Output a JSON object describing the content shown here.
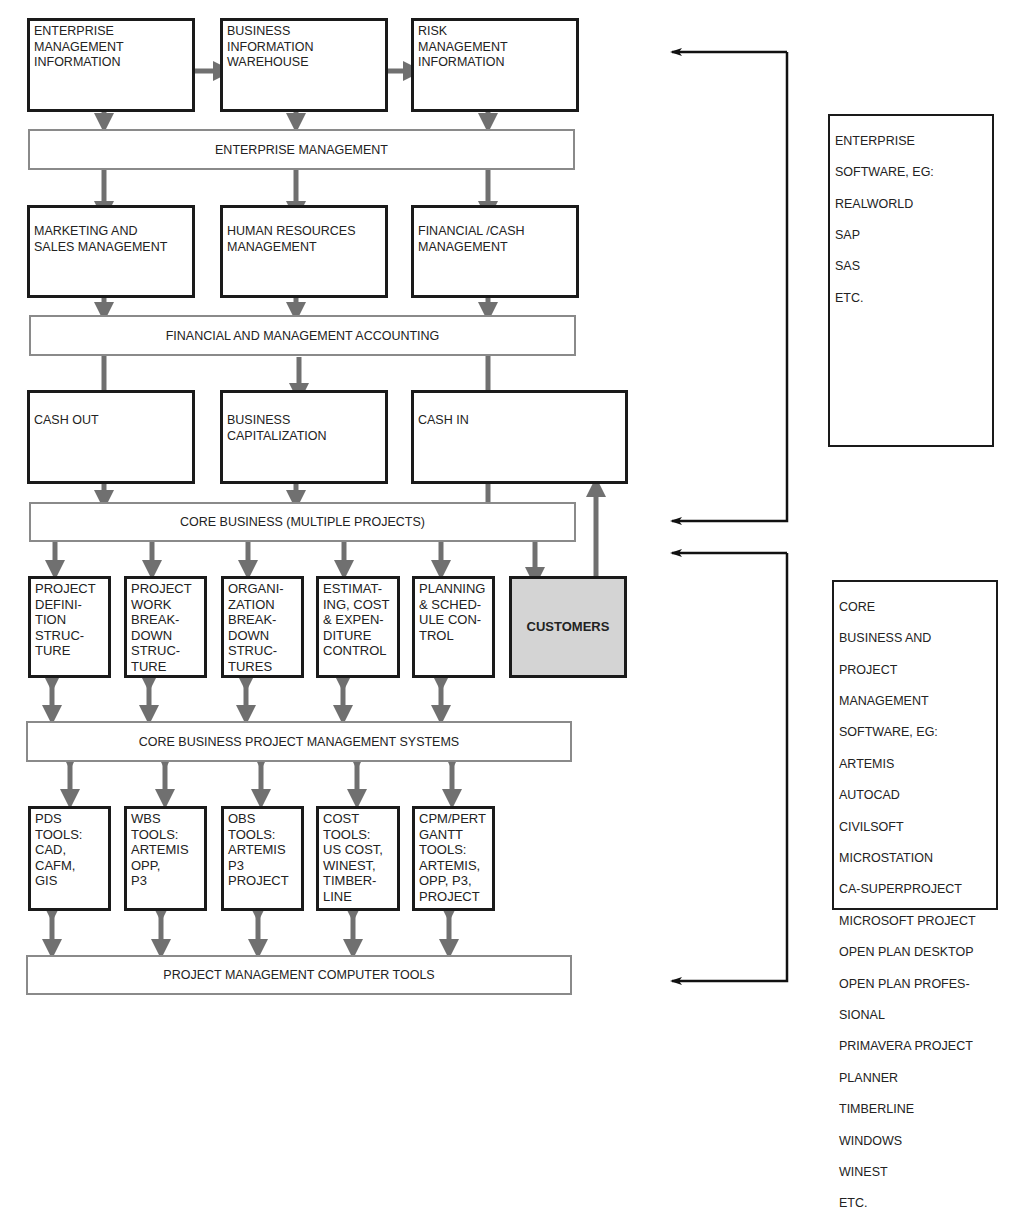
{
  "diagram": {
    "top_row": [
      {
        "label": "ENTERPRISE\nMANAGEMENT\nINFORMATION"
      },
      {
        "label": "BUSINESS\nINFORMATION\nWAREHOUSE"
      },
      {
        "label": "RISK\nMANAGEMENT\nINFORMATION"
      }
    ],
    "band_enterprise": "ENTERPRISE MANAGEMENT",
    "mgmt_row": [
      {
        "label": "MARKETING AND\nSALES MANAGEMENT"
      },
      {
        "label": "HUMAN RESOURCES\nMANAGEMENT"
      },
      {
        "label": "FINANCIAL /CASH\nMANAGEMENT"
      }
    ],
    "band_accounting": "FINANCIAL AND MANAGEMENT ACCOUNTING",
    "cash_row": [
      {
        "label": "CASH OUT"
      },
      {
        "label": "BUSINESS\nCAPITALIZATION"
      },
      {
        "label": "CASH IN"
      }
    ],
    "band_core": "CORE BUSINESS (MULTIPLE PROJECTS)",
    "structure_row": [
      {
        "label": "PROJECT\nDEFINI-\nTION\nSTRUC-\nTURE"
      },
      {
        "label": "PROJECT\nWORK\nBREAK-\nDOWN\nSTRUC-\nTURE"
      },
      {
        "label": "ORGANI-\nZATION\nBREAK-\nDOWN\nSTRUC-\nTURES"
      },
      {
        "label": "ESTIMAT-\nING,  COST\n& EXPEN-\nDITURE\nCONTROL"
      },
      {
        "label": "PLANNING\n& SCHED-\nULE CON-\nTROL"
      },
      {
        "label": "CUSTOMERS"
      }
    ],
    "band_pm_systems": "CORE BUSINESS PROJECT MANAGEMENT SYSTEMS",
    "tools_row": [
      {
        "label": "PDS\nTOOLS:\nCAD,\nCAFM,\nGIS"
      },
      {
        "label": "WBS\nTOOLS:\nARTEMIS\nOPP,\nP3"
      },
      {
        "label": "OBS\nTOOLS:\nARTEMIS\nP3\nPROJECT"
      },
      {
        "label": "COST\nTOOLS:\nUS COST,\nWINEST,\nTIMBER-\nLINE"
      },
      {
        "label": "CPM/PERT\nGANTT\nTOOLS:\nARTEMIS,\nOPP, P3,\nPROJECT"
      }
    ],
    "band_pm_tools": "PROJECT MANAGEMENT COMPUTER TOOLS",
    "side_enterprise": {
      "lines": [
        "ENTERPRISE",
        "SOFTWARE, EG:",
        "REALWORLD",
        "SAP",
        "SAS",
        "ETC."
      ]
    },
    "side_core": {
      "lines": [
        "CORE",
        "BUSINESS AND",
        "PROJECT",
        "MANAGEMENT",
        "SOFTWARE, EG:",
        "ARTEMIS",
        "AUTOCAD",
        "CIVILSOFT",
        "MICROSTATION",
        "CA-SUPERPROJECT",
        "MICROSOFT PROJECT",
        "OPEN PLAN DESKTOP",
        "OPEN PLAN PROFES-",
        "SIONAL",
        "PRIMAVERA PROJECT",
        "PLANNER",
        "TIMBERLINE",
        "WINDOWS",
        "WINEST",
        "ETC."
      ]
    },
    "colors": {
      "box_border": "#1a1a1a",
      "band_border": "#8a8a8a",
      "arrow": "#707070",
      "connector": "#1a1a1a",
      "customers_fill": "#d4d4d4"
    }
  }
}
